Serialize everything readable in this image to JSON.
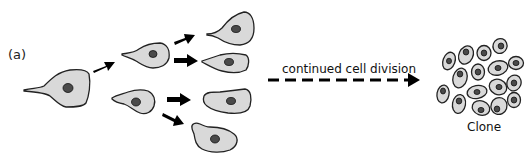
{
  "figure": {
    "panel_label": "(a)",
    "process_label": "continued cell division",
    "clone_label": "Clone",
    "colors": {
      "cell_fill": "#d9d9d9",
      "cell_outline": "#222222",
      "nucleus": "#4a4a4a",
      "arrow": "#000000"
    }
  },
  "stages": [
    {
      "name": "original-cell",
      "count": 1
    },
    {
      "name": "first-division-daughters",
      "count": 2
    },
    {
      "name": "second-division-granddaughters",
      "count": 4
    },
    {
      "name": "clone-cluster",
      "count": 17
    }
  ]
}
